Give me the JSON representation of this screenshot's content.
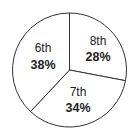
{
  "chart_data": {
    "type": "pie",
    "title": "",
    "categories": [
      "8th",
      "7th",
      "6th"
    ],
    "values": [
      28,
      34,
      38
    ],
    "labels": [
      "28%",
      "34%",
      "38%"
    ],
    "start_angle": "12 o'clock",
    "direction": "clockwise",
    "legend": "none",
    "colors": {
      "fill": "#ffffff",
      "stroke": "#333333"
    }
  },
  "slices": [
    {
      "name": "8th",
      "percent": "28%"
    },
    {
      "name": "7th",
      "percent": "34%"
    },
    {
      "name": "6th",
      "percent": "38%"
    }
  ]
}
